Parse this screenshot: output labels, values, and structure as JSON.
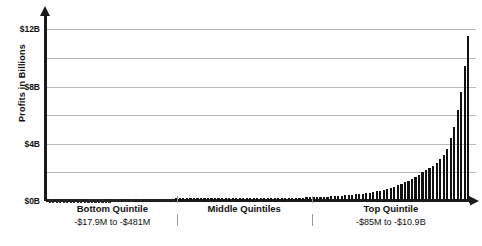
{
  "chart_data": {
    "type": "bar",
    "title": "",
    "subtitle": "",
    "xlabel": "",
    "ylabel": "Profits in Billions",
    "ylim": [
      0,
      12.8
    ],
    "grid": true,
    "legend": false,
    "y_axis": {
      "tick_labels": [
        "$0B",
        "$4B",
        "$8B",
        "$12B"
      ],
      "tick_values": [
        0,
        4,
        8,
        12
      ],
      "gridline_values": [
        0,
        2,
        4,
        6,
        8,
        10,
        12
      ],
      "unit": "Billions of dollars"
    },
    "x_axis": {
      "segments": [
        {
          "label": "Bottom Quintile",
          "sublabel": "-$17.9M to -$481M",
          "start_fraction": 0.0,
          "end_fraction": 0.305
        },
        {
          "label": "Middle Quintiles",
          "sublabel": "",
          "start_fraction": 0.305,
          "end_fraction": 0.625
        },
        {
          "label": "Top Quintile",
          "sublabel": "-$85M to -$10.9B",
          "start_fraction": 0.625,
          "end_fraction": 1.0
        }
      ]
    },
    "categories": [
      "1",
      "2",
      "3",
      "4",
      "5",
      "6",
      "7",
      "8",
      "9",
      "10",
      "11",
      "12",
      "13",
      "14",
      "15",
      "16",
      "17",
      "18",
      "19",
      "20",
      "21",
      "22",
      "23",
      "24",
      "25",
      "26",
      "27",
      "28",
      "29",
      "30",
      "31",
      "32",
      "33",
      "34",
      "35",
      "36",
      "37",
      "38",
      "39",
      "40",
      "41",
      "42",
      "43",
      "44",
      "45",
      "46",
      "47",
      "48",
      "49",
      "50",
      "51",
      "52",
      "53",
      "54",
      "55",
      "56",
      "57",
      "58",
      "59",
      "60",
      "61",
      "62",
      "63",
      "64",
      "65",
      "66",
      "67",
      "68",
      "69",
      "70",
      "71",
      "72",
      "73",
      "74",
      "75",
      "76",
      "77",
      "78",
      "79",
      "80",
      "81",
      "82",
      "83",
      "84",
      "85",
      "86",
      "87",
      "88",
      "89",
      "90",
      "91",
      "92",
      "93",
      "94",
      "95",
      "96",
      "97",
      "98",
      "99",
      "100",
      "101",
      "102",
      "103",
      "104",
      "105",
      "106",
      "107",
      "108",
      "109",
      "110",
      "111",
      "112",
      "113",
      "114",
      "115",
      "116",
      "117",
      "118",
      "119",
      "120"
    ],
    "values": [
      -0.45,
      -0.42,
      -0.4,
      -0.38,
      -0.36,
      -0.34,
      -0.33,
      -0.31,
      -0.3,
      -0.28,
      -0.27,
      -0.26,
      -0.25,
      -0.24,
      -0.23,
      -0.22,
      -0.21,
      -0.2,
      -0.19,
      -0.18,
      -0.17,
      -0.16,
      -0.15,
      -0.14,
      -0.13,
      -0.12,
      -0.11,
      -0.1,
      -0.09,
      -0.08,
      -0.07,
      -0.06,
      -0.05,
      -0.04,
      -0.03,
      -0.02,
      0.01,
      0.01,
      0.01,
      0.01,
      0.01,
      0.02,
      0.02,
      0.02,
      0.02,
      0.02,
      0.02,
      0.03,
      0.03,
      0.03,
      0.03,
      0.03,
      0.04,
      0.04,
      0.04,
      0.04,
      0.04,
      0.05,
      0.05,
      0.05,
      0.05,
      0.06,
      0.06,
      0.06,
      0.07,
      0.07,
      0.07,
      0.08,
      0.08,
      0.09,
      0.09,
      0.1,
      0.1,
      0.11,
      0.12,
      0.13,
      0.14,
      0.15,
      0.16,
      0.17,
      0.18,
      0.2,
      0.22,
      0.24,
      0.26,
      0.28,
      0.3,
      0.33,
      0.36,
      0.39,
      0.42,
      0.46,
      0.5,
      0.55,
      0.6,
      0.66,
      0.72,
      0.79,
      0.87,
      0.96,
      1.06,
      1.17,
      1.29,
      1.42,
      1.56,
      1.72,
      1.9,
      2.05,
      2.2,
      2.35,
      2.55,
      2.8,
      3.1,
      3.55,
      4.3,
      5.1,
      6.3,
      7.6,
      9.4,
      11.5
    ],
    "notes": {
      "peak_value": 11.5,
      "peak_label": "$11.5B",
      "bar_color": "#111111"
    }
  },
  "colors": {
    "axis": "#1a1a1a",
    "grid": "#b9b9b9",
    "bar": "#111111",
    "text": "#111111",
    "background": "#ffffff"
  }
}
